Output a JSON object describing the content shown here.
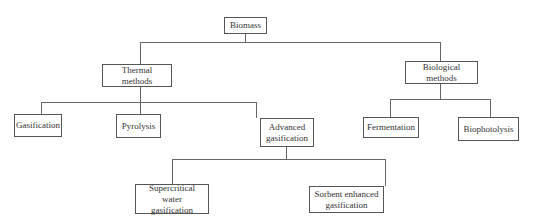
{
  "diagram": {
    "type": "tree",
    "root": {
      "label": "Biomass",
      "children": [
        {
          "label": "Thermal methods",
          "children": [
            {
              "label": "Gasification"
            },
            {
              "label": "Pyrolysis"
            },
            {
              "label": "Advanced gasification",
              "children": [
                {
                  "label": "Supercritical water gasification"
                },
                {
                  "label": "Sorbent enhanced gasification"
                }
              ]
            }
          ]
        },
        {
          "label": "Biological methods",
          "children": [
            {
              "label": "Fermentation"
            },
            {
              "label": "Biophotolysis"
            }
          ]
        }
      ]
    }
  },
  "nodes": {
    "biomass": "Biomass",
    "thermal": "Thermal methods",
    "biological": "Biological methods",
    "gasification": "Gasification",
    "pyrolysis": "Pyrolysis",
    "advanced_1": "Advanced",
    "advanced_2": "gasification",
    "fermentation": "Fermentation",
    "biophotolysis": "Biophotolysis",
    "supercritical_1": "Supercritical water",
    "supercritical_2": "gasification",
    "sorbent_1": "Sorbent enhanced",
    "sorbent_2": "gasification"
  },
  "colors": {
    "line": "#666666",
    "border": "#555555",
    "text": "#333333",
    "background": "#ffffff"
  }
}
